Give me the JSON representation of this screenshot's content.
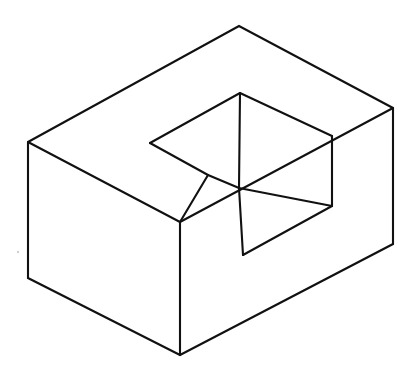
{
  "figure": {
    "kind": "line-drawing",
    "background_color": "#ffffff",
    "stroke_color": "#111111",
    "fill_color": "#ffffff",
    "stroke_width": 2.1,
    "canvas": {
      "width": 416,
      "height": 376
    },
    "vertices": {
      "outer_left_top": [
        28,
        142
      ],
      "outer_left_bottom": [
        28,
        278
      ],
      "outer_top_apex": [
        239,
        26
      ],
      "outer_right_top": [
        393,
        108
      ],
      "outer_right_bottom": [
        393,
        244
      ],
      "outer_front_top": [
        180,
        222
      ],
      "outer_front_bottom": [
        180,
        355
      ],
      "notch_left_point": [
        150,
        143
      ],
      "notch_top_apex": [
        240,
        93
      ],
      "notch_inner_top_right": [
        332,
        136
      ],
      "notch_inner_right": [
        332,
        206
      ],
      "notch_junction": [
        239,
        188
      ],
      "notch_mid_point": [
        208,
        175
      ],
      "notch_inner_bottom": [
        243,
        255
      ],
      "notch_step_right": [
        315,
        224
      ]
    },
    "paths": {
      "outer_silhouette": "M28,142 L239,26 L393,108 L393,244 L180,355 L28,278 Z",
      "top_face": "M28,142 L239,26 L393,108 L332,136 L240,93 L150,143 L208,175 L180,222 Z",
      "left_face": "M28,142 L180,222 L180,355 L28,278 Z",
      "right_face": "M180,222 L393,108 L393,244 L180,355 Z",
      "notch_inner_left_wall": "M150,143 L208,175 L208,175 L239,188 L239,93",
      "notch_inner_floor": "M239,188 L332,206 L315,224 L243,255 L239,188",
      "notch_vertical_back": "M240,93 L239,188",
      "notch_right_wall": "M332,136 L332,206",
      "notch_front_step": "M243,255 L332,206"
    },
    "edges": [
      {
        "name": "top-left-upper",
        "from": [
          28,
          142
        ],
        "to": [
          239,
          26
        ]
      },
      {
        "name": "top-right-upper",
        "from": [
          239,
          26
        ],
        "to": [
          393,
          108
        ]
      },
      {
        "name": "left-vertical",
        "from": [
          28,
          142
        ],
        "to": [
          28,
          278
        ]
      },
      {
        "name": "right-vertical",
        "from": [
          393,
          108
        ],
        "to": [
          393,
          244
        ]
      },
      {
        "name": "front-vertical",
        "from": [
          180,
          222
        ],
        "to": [
          180,
          355
        ]
      },
      {
        "name": "bottom-left",
        "from": [
          28,
          278
        ],
        "to": [
          180,
          355
        ]
      },
      {
        "name": "bottom-right",
        "from": [
          180,
          355
        ],
        "to": [
          393,
          244
        ]
      },
      {
        "name": "top-face-left-diagonal",
        "from": [
          28,
          142
        ],
        "to": [
          180,
          222
        ]
      },
      {
        "name": "top-face-right-diagonal",
        "from": [
          180,
          222
        ],
        "to": [
          393,
          108
        ]
      },
      {
        "name": "notch-left-upper",
        "from": [
          150,
          143
        ],
        "to": [
          240,
          93
        ]
      },
      {
        "name": "notch-left-lower",
        "from": [
          150,
          143
        ],
        "to": [
          208,
          175
        ]
      },
      {
        "name": "notch-ledge-to-front",
        "from": [
          208,
          175
        ],
        "to": [
          180,
          222
        ]
      },
      {
        "name": "notch-top-to-right",
        "from": [
          240,
          93
        ],
        "to": [
          332,
          136
        ]
      },
      {
        "name": "notch-right-vertical",
        "from": [
          332,
          136
        ],
        "to": [
          332,
          206
        ]
      },
      {
        "name": "notch-back-vertical",
        "from": [
          240,
          93
        ],
        "to": [
          239,
          188
        ]
      },
      {
        "name": "notch-floor-left",
        "from": [
          208,
          175
        ],
        "to": [
          239,
          188
        ]
      },
      {
        "name": "notch-floor-right",
        "from": [
          239,
          188
        ],
        "to": [
          332,
          206
        ]
      },
      {
        "name": "notch-front-vertical",
        "from": [
          239,
          188
        ],
        "to": [
          243,
          255
        ]
      },
      {
        "name": "notch-front-diagonal",
        "from": [
          243,
          255
        ],
        "to": [
          332,
          206
        ]
      }
    ],
    "artifacts": [
      {
        "name": "faint-speck",
        "position": [
          18,
          252
        ],
        "radius": 1.2,
        "color": "#cfcfcf"
      }
    ]
  }
}
